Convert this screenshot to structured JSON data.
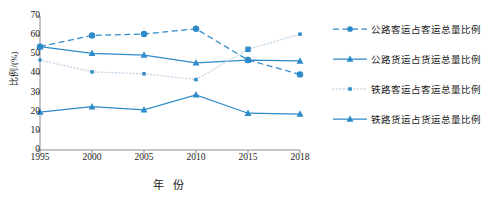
{
  "chart_data": {
    "type": "line",
    "title": "",
    "xlabel": "年 份",
    "ylabel": "比例/(%)",
    "categories": [
      "1995",
      "2000",
      "2005",
      "2010",
      "2015",
      "2018"
    ],
    "x": [
      1995,
      2000,
      2005,
      2010,
      2015,
      2018
    ],
    "xlim": [
      1995,
      2018
    ],
    "ylim": [
      0,
      70
    ],
    "yticks": [
      "0",
      "10",
      "20",
      "30",
      "40",
      "50",
      "60",
      "70"
    ],
    "ytick_values": [
      0,
      10,
      20,
      30,
      40,
      50,
      60,
      70
    ],
    "grid": false,
    "legend_position": "right",
    "series": [
      {
        "name": "公路客运占客运总量比例",
        "values": [
          54,
          59.8,
          60.6,
          63.3,
          47,
          39.5
        ],
        "marker": "circle",
        "line_style": "dashed",
        "color": "#2E8BC9"
      },
      {
        "name": "公路货运占货运总量比例",
        "values": [
          54,
          50.5,
          49.6,
          45.5,
          47,
          46.5
        ],
        "marker": "triangle",
        "line_style": "solid",
        "color": "#2E8BC9"
      },
      {
        "name": "铁路客运占客运总量比例",
        "values": [
          47,
          40.8,
          39.8,
          36.8,
          52.6,
          60.5
        ],
        "marker": "square",
        "line_style": "dotted",
        "color": "#2E8BC9"
      },
      {
        "name": "铁路货运占货运总量比例",
        "values": [
          19.8,
          22.6,
          21,
          28.8,
          19.2,
          18.8
        ],
        "marker": "triangle",
        "line_style": "solid",
        "color": "#2E8BC9"
      }
    ]
  },
  "colors": {
    "accent": "#2E8BC9",
    "dotted_line": "#C9D9E8",
    "axis": "#808080",
    "text": "#1a1a1a"
  }
}
